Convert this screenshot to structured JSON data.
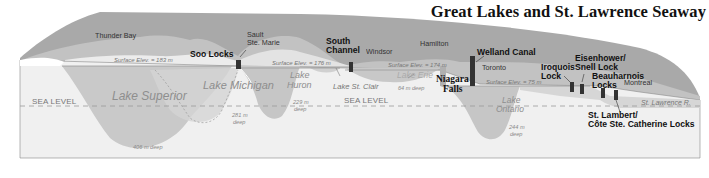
{
  "title": "Great Lakes and St. Lawrence Seaway",
  "colors": {
    "land": "#a8a8a8",
    "land_light": "#c4c4c4",
    "water_surface": "#e6e6e6",
    "lake_body": "#c9c9c9",
    "ground": "#f0f0f0",
    "lock": "#333333",
    "sea_line": "#9a9a9a"
  },
  "sea_level_labels": [
    "SEA LEVEL",
    "SEA LEVEL"
  ],
  "cities": {
    "thunder_bay": "Thunder Bay",
    "sault_ste_marie_1": "Sault",
    "sault_ste_marie_2": "Ste. Marie",
    "windsor": "Windsor",
    "hamilton": "Hamilton",
    "toronto": "Toronto",
    "montreal": "Montreal"
  },
  "locks": {
    "soo": "Soo Locks",
    "south_channel_1": "South",
    "south_channel_2": "Channel",
    "welland": "Welland Canal",
    "iroquois_1": "Iroquois",
    "iroquois_2": "Lock",
    "eisenhower_1": "Eisenhower/",
    "eisenhower_2": "Snell Lock",
    "beauharnois_1": "Beauharnois",
    "beauharnois_2": "Locks",
    "st_lambert_1": "St. Lambert/",
    "st_lambert_2": "Côte Ste. Catherine Locks"
  },
  "features": {
    "niagara_1": "Niagara",
    "niagara_2": "Falls",
    "st_lawrence_river": "St. Lawrence R."
  },
  "surface_elevations": {
    "superior": "Surface Elev. = 183 m",
    "michigan_huron": "Surface Elev. = 176 m",
    "erie": "Surface Elev. = 174 m",
    "ontario": "Surface Elev. = 75 m"
  },
  "lakes": {
    "superior": "Lake Superior",
    "michigan": "Lake Michigan",
    "huron_1": "Lake",
    "huron_2": "Huron",
    "st_clair": "Lake St. Clair",
    "erie": "Lake Erie",
    "ontario_1": "Lake",
    "ontario_2": "Ontario"
  },
  "depths": {
    "superior": "406 m deep",
    "michigan_1": "281 m",
    "michigan_2": "deep",
    "huron_1": "229 m",
    "huron_2": "deep",
    "erie": "64 m deep",
    "ontario_1": "244 m",
    "ontario_2": "deep"
  }
}
